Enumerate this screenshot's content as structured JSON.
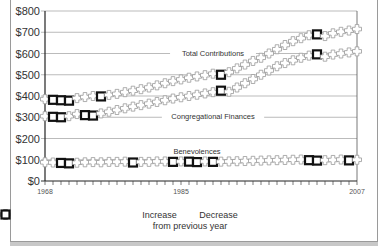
{
  "chart_data": {
    "type": "line",
    "title": "",
    "xlabel": "",
    "ylabel": "",
    "x_start": 1968,
    "x_end": 2007,
    "x_ticks": [
      "1968",
      "1985",
      "2007"
    ],
    "y_ticks": [
      "$0",
      "$100",
      "$200",
      "$300",
      "$400",
      "$500",
      "$600",
      "$700",
      "$800"
    ],
    "ylim": [
      0,
      800
    ],
    "grid": true,
    "series": [
      {
        "name": "Total Contributions",
        "label_x_year": 1989,
        "label_y": 603,
        "values": [
          385,
          382,
          380,
          378,
          390,
          395,
          400,
          398,
          405,
          410,
          418,
          425,
          432,
          440,
          450,
          460,
          470,
          478,
          486,
          492,
          498,
          505,
          500,
          512,
          530,
          548,
          565,
          580,
          600,
          620,
          640,
          658,
          672,
          686,
          690,
          682,
          695,
          702,
          708,
          715
        ],
        "decreases": [
          1969,
          1970,
          1971,
          1975,
          1990,
          2002
        ]
      },
      {
        "name": "Congregational Finances",
        "label_x_year": 1989,
        "label_y": 305,
        "values": [
          305,
          302,
          300,
          305,
          315,
          310,
          308,
          318,
          326,
          334,
          342,
          350,
          357,
          364,
          372,
          380,
          388,
          394,
          400,
          406,
          412,
          418,
          425,
          420,
          440,
          460,
          480,
          500,
          520,
          540,
          555,
          568,
          580,
          590,
          596,
          585,
          595,
          600,
          605,
          610
        ],
        "decreases": [
          1969,
          1970,
          1973,
          1974,
          1990,
          2002
        ]
      },
      {
        "name": "Benevolences",
        "label_x_year": 1987,
        "label_y": 140,
        "values": [
          88,
          87,
          85,
          83,
          86,
          88,
          89,
          88,
          90,
          90,
          91,
          87,
          90,
          90,
          92,
          92,
          90,
          92,
          91,
          89,
          92,
          90,
          91,
          92,
          93,
          94,
          95,
          96,
          97,
          98,
          99,
          100,
          101,
          98,
          96,
          98,
          99,
          101,
          97,
          100
        ],
        "decreases": [
          1970,
          1971,
          1979,
          1984,
          1986,
          1987,
          1989,
          2001,
          2002,
          2006
        ]
      }
    ],
    "legend": {
      "items": [
        {
          "label": "Increase",
          "symbol": "cross-outline"
        },
        {
          "label": "Decrease",
          "symbol": "bold-square"
        }
      ],
      "subtitle": "from previous year",
      "position": "bottom"
    }
  }
}
